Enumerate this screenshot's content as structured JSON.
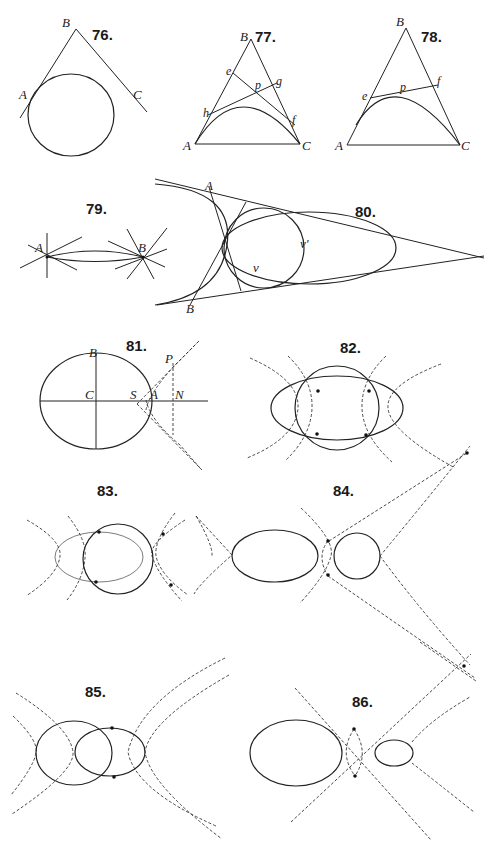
{
  "plate": {
    "background": "#ffffff",
    "ink": "#222222",
    "figures": [
      {
        "id": "76",
        "label": "76.",
        "points": [
          "A",
          "B",
          "C"
        ],
        "description": "Ellipse with two tangents from external point B touching at A and C"
      },
      {
        "id": "77",
        "label": "77.",
        "points": [
          "B",
          "e",
          "p",
          "g",
          "h",
          "f",
          "A",
          "C"
        ],
        "description": "Triangle ABC with inscribed parabolic arc and tangent lines through p"
      },
      {
        "id": "78",
        "label": "78.",
        "points": [
          "B",
          "e",
          "p",
          "f",
          "A",
          "C"
        ],
        "description": "Triangle ABC with inscribed arc and tangent ef at p"
      },
      {
        "id": "79",
        "label": "79.",
        "points": [
          "A",
          "B"
        ],
        "description": "Two points A and B with pencils of lines and thin lens-shaped arcs"
      },
      {
        "id": "80",
        "label": "80.",
        "points": [
          "A",
          "B",
          "v",
          "v'"
        ],
        "description": "Large circle arc, inner circle and ellipse tangent to two converging lines"
      },
      {
        "id": "81",
        "label": "81.",
        "points": [
          "B",
          "C",
          "S",
          "A",
          "N",
          "P"
        ],
        "description": "Ellipse with axes, focus S, vertex A, point P with dashed asymptote lines"
      },
      {
        "id": "82",
        "label": "82.",
        "points": [],
        "description": "Circle and ellipse intersecting at four points with dashed hyperbolas"
      },
      {
        "id": "83",
        "label": "83.",
        "points": [],
        "description": "Ellipse and circle intersecting with dashed curves"
      },
      {
        "id": "84",
        "label": "84.",
        "points": [],
        "description": "Ellipse and circle separated, dashed curves and long dashed tangents"
      },
      {
        "id": "85",
        "label": "85.",
        "points": [],
        "description": "Two overlapping ellipses with dashed hyperbolas"
      },
      {
        "id": "86",
        "label": "86.",
        "points": [],
        "description": "Large and small ellipse with dashed conics between them"
      }
    ]
  }
}
